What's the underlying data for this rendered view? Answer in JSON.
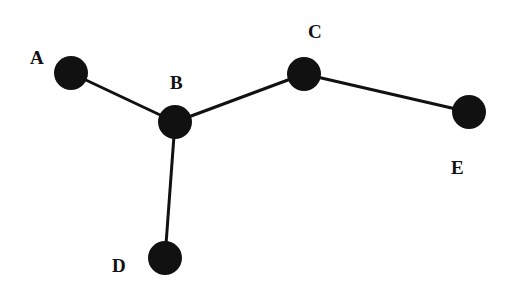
{
  "diagram": {
    "type": "graph",
    "nodes": [
      {
        "id": "A",
        "label": "A",
        "cx": 71,
        "cy": 73,
        "r": 17,
        "lx": 30,
        "ly": 64
      },
      {
        "id": "B",
        "label": "B",
        "cx": 175,
        "cy": 122,
        "r": 17,
        "lx": 170,
        "ly": 89
      },
      {
        "id": "C",
        "label": "C",
        "cx": 304,
        "cy": 74,
        "r": 17,
        "lx": 308,
        "ly": 38
      },
      {
        "id": "D",
        "label": "D",
        "cx": 165,
        "cy": 258,
        "r": 17,
        "lx": 112,
        "ly": 272
      },
      {
        "id": "E",
        "label": "E",
        "cx": 469,
        "cy": 112,
        "r": 17,
        "lx": 451,
        "ly": 174
      }
    ],
    "edges": [
      {
        "from": "A",
        "to": "B"
      },
      {
        "from": "B",
        "to": "C"
      },
      {
        "from": "C",
        "to": "E"
      },
      {
        "from": "B",
        "to": "D"
      }
    ],
    "colors": {
      "node": "#111111",
      "edge": "#111111",
      "background": "#ffffff"
    }
  }
}
